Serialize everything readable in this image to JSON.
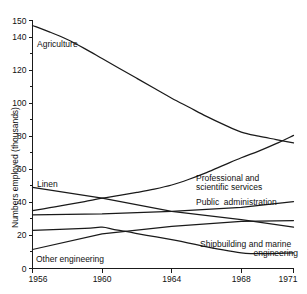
{
  "chart_data": {
    "type": "line",
    "title": "",
    "xlabel": "",
    "ylabel": "Numbers employed (thousands)",
    "xlim": [
      1956,
      1971
    ],
    "ylim": [
      0,
      150
    ],
    "grid": false,
    "legend_position": "inline-labels",
    "x_ticks": [
      "1956",
      "1960",
      "1964",
      "1968",
      "1971"
    ],
    "x_tick_values": [
      1956,
      1960,
      1964,
      1968,
      1971
    ],
    "y_ticks": [
      "0",
      "20",
      "40",
      "60",
      "80",
      "100",
      "120",
      "140",
      "150"
    ],
    "y_tick_values": [
      0,
      20,
      40,
      60,
      80,
      100,
      120,
      140,
      150
    ],
    "y_minor_tick_values": [
      10,
      30,
      50,
      70,
      90,
      110,
      130
    ],
    "series": [
      {
        "name": "Agriculture",
        "label": "Agriculture",
        "x": [
          1956,
          1957,
          1958,
          1959,
          1960,
          1961,
          1962,
          1963,
          1964,
          1965,
          1966,
          1967,
          1968,
          1969,
          1970,
          1971
        ],
        "values": [
          147,
          143,
          138.5,
          133,
          127,
          121,
          115,
          109,
          103,
          97.5,
          92,
          87,
          82.5,
          80,
          78,
          76
        ]
      },
      {
        "name": "Professional and scientific services",
        "label": "Professional and\nscientific services",
        "x": [
          1956,
          1957,
          1958,
          1959,
          1960,
          1961,
          1962,
          1963,
          1964,
          1965,
          1966,
          1967,
          1968,
          1969,
          1970,
          1971
        ],
        "values": [
          35,
          36.8,
          38.6,
          40.5,
          42.5,
          44.2,
          46,
          48,
          50.5,
          54,
          58,
          62.5,
          67,
          71,
          75.5,
          80.5
        ]
      },
      {
        "name": "Public administration",
        "label": "Public  administration",
        "x": [
          1956,
          1960,
          1964,
          1968,
          1971
        ],
        "values": [
          32.5,
          33,
          34.5,
          37,
          40.5
        ]
      },
      {
        "name": "Linen",
        "label": "Linen",
        "x": [
          1956,
          1960,
          1964,
          1968,
          1971
        ],
        "values": [
          49,
          42.5,
          34.5,
          29.5,
          25
        ]
      },
      {
        "name": "Other engineering",
        "label": "Other engineering",
        "x": [
          1956,
          1960,
          1964,
          1968,
          1971
        ],
        "values": [
          11.5,
          21,
          25.5,
          28.5,
          29
        ]
      },
      {
        "name": "Shipbuilding and marine engineering",
        "label": "Shipbuilding and marine\nengineering",
        "x": [
          1956,
          1959,
          1960,
          1961,
          1964,
          1968,
          1971
        ],
        "values": [
          23,
          24.2,
          25,
          23,
          17.5,
          9.5,
          9.5
        ]
      }
    ]
  },
  "annotations": {
    "agriculture": {
      "text": "Agriculture"
    },
    "linen": {
      "text": "Linen"
    },
    "other_engineering": {
      "text": "Other engineering"
    },
    "professional_line1": {
      "text": "Professional and"
    },
    "professional_line2": {
      "text": "scientific services"
    },
    "public_administration": {
      "text": "Public  administration"
    },
    "shipbuilding_line1": {
      "text": "Shipbuilding and marine"
    },
    "shipbuilding_line2": {
      "text": "engineering"
    }
  },
  "axis": {
    "y_title": "Numbers employed (thousands)"
  },
  "colors": {
    "line": "#1a1a1a",
    "background": "#ffffff",
    "text": "#111111"
  }
}
